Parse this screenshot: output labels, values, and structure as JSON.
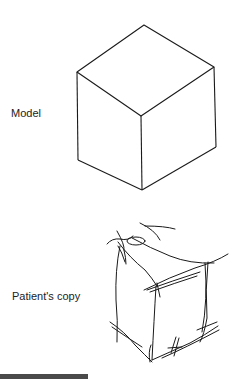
{
  "figure": {
    "model_label": "Model",
    "copy_label": "Patient's copy"
  },
  "colors": {
    "line": "#1a1a1a",
    "background": "#ffffff"
  }
}
